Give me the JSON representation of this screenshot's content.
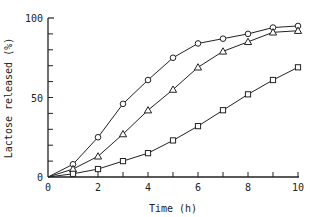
{
  "chart_data": {
    "type": "line",
    "title": "",
    "xlabel": "Time (h)",
    "ylabel": "Lactose released (%)",
    "xlim": [
      0,
      10
    ],
    "ylim": [
      0,
      100
    ],
    "x_ticks": [
      0,
      2,
      4,
      6,
      8,
      10
    ],
    "x_minor_ticks": [
      1,
      3,
      5,
      7,
      9
    ],
    "y_ticks": [
      0,
      50,
      100
    ],
    "y_minor_ticks": [
      10,
      20,
      30,
      40,
      60,
      70,
      80,
      90
    ],
    "grid": false,
    "legend": null,
    "x": [
      1,
      2,
      3,
      4,
      5,
      6,
      7,
      8,
      9,
      10
    ],
    "series": [
      {
        "name": "circle",
        "marker": "circle",
        "values": [
          8,
          25,
          46,
          61,
          75,
          84,
          87,
          90,
          94,
          95
        ]
      },
      {
        "name": "triangle",
        "marker": "triangle",
        "values": [
          5,
          13,
          27,
          42,
          55,
          69,
          79,
          85,
          91,
          92
        ]
      },
      {
        "name": "square",
        "marker": "square",
        "values": [
          2,
          5,
          10,
          15,
          23,
          32,
          42,
          52,
          61,
          69
        ]
      }
    ]
  },
  "labels": {
    "xlabel": "Time (h)",
    "ylabel": "Lactose released (%)",
    "origin": "0"
  }
}
